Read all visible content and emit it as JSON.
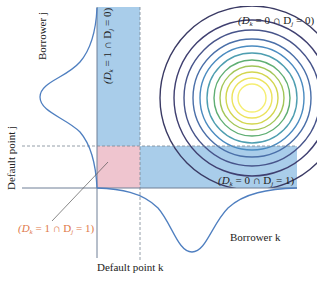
{
  "figure": {
    "type": "bivariate default diagram",
    "colors": {
      "band_blue": "#a9cdea",
      "joint_default_pink": "#efc5cf",
      "axis_line": "#6f7f96",
      "dashed_line": "#7a8593",
      "marginal_curve": "#4f7fc0",
      "joint_label_orange": "#e0794a",
      "text": "#222222",
      "contour_colors": [
        "#f5ee72",
        "#e9e45a",
        "#cfd84f",
        "#9cc457",
        "#5fae73",
        "#4e9eb0",
        "#4a8bc0",
        "#4a6fa8",
        "#47548a",
        "#3f3f70",
        "#3a3a64"
      ]
    },
    "labels": {
      "borrower_j": "Borrower j",
      "borrower_k": "Borrower k",
      "default_point_j": "Default point j",
      "default_point_k": "Default point k"
    },
    "regions": {
      "no_default": {
        "text": "(D",
        "k": "k",
        "mid": " = 0 ∩ D",
        "j": "j",
        "end": " = 0)"
      },
      "k_default_only": {
        "text": "(D",
        "k": "k",
        "mid": " = 1 ∩ D",
        "j": "j",
        "end": " = 0)"
      },
      "j_default_only": {
        "text": "(D",
        "k": "k",
        "mid": " = 0 ∩ D",
        "j": "j",
        "end": " = 1)"
      },
      "joint_default": {
        "text": "(D",
        "k": "k",
        "mid": " = 1 ∩ D",
        "j": "j",
        "end": " = 1)"
      }
    },
    "contours": {
      "center": [
        252,
        98
      ],
      "radii": [
        14,
        20,
        26,
        32,
        38,
        45,
        52,
        59,
        68,
        78,
        92
      ]
    }
  }
}
